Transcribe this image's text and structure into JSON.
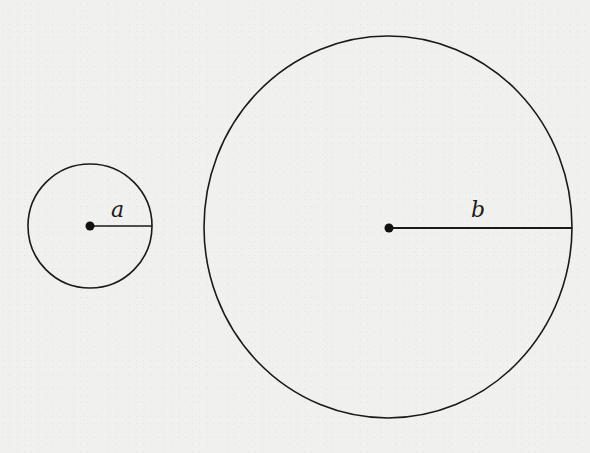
{
  "diagram": {
    "colors": {
      "background": "#f0f0ef",
      "stroke": "#1a1a1a"
    },
    "circles": [
      {
        "id": "small",
        "cx": 90,
        "cy": 226,
        "r": 62,
        "radius_label": "a"
      },
      {
        "id": "large",
        "cx": 388,
        "cy": 227,
        "rx": 184,
        "ry": 191,
        "radius_label": "b"
      }
    ]
  }
}
